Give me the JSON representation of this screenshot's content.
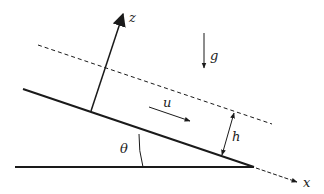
{
  "diagram": {
    "type": "inclined-film-flow",
    "colors": {
      "line": "#1a1a1a",
      "background": "#ffffff"
    },
    "labels": {
      "z_axis": "z",
      "x_axis": "x",
      "gravity": "g",
      "velocity": "u",
      "thickness": "h",
      "angle": "θ"
    },
    "elements": {
      "incline": {
        "x1": 23,
        "y1": 89,
        "x2": 254,
        "y2": 167
      },
      "base": {
        "x1": 15,
        "y1": 167,
        "x2": 254,
        "y2": 167
      },
      "free_surface": {
        "x1": 38,
        "y1": 45,
        "x2": 272,
        "y2": 124,
        "style": "dashed"
      },
      "z_axis": {
        "x1": 91,
        "y1": 111,
        "x2": 124,
        "y2": 11
      },
      "x_axis": {
        "x1": 254,
        "y1": 167,
        "x2": 297,
        "y2": 182,
        "style": "dashed"
      },
      "gravity_arrow": {
        "x1": 204,
        "y1": 33,
        "x2": 204,
        "y2": 68
      },
      "velocity_arrow": {
        "x1": 148,
        "y1": 107,
        "x2": 190,
        "y2": 121
      },
      "thickness_arrow": {
        "x1": 234,
        "y1": 112,
        "x2": 222,
        "y2": 156
      }
    }
  }
}
